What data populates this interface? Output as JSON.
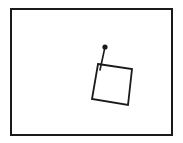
{
  "drawing": {
    "stroke_color": "#1a1a1a",
    "background": "#ffffff",
    "frame": {
      "x": 11,
      "y": 9,
      "width": 161,
      "height": 126
    },
    "square": {
      "points": "98,64 132,69 128,105 92,99"
    },
    "stem": {
      "x1": 100,
      "y1": 70,
      "x2": 105,
      "y2": 47
    },
    "dot": {
      "cx": 105,
      "cy": 47,
      "r": 2.6
    }
  }
}
